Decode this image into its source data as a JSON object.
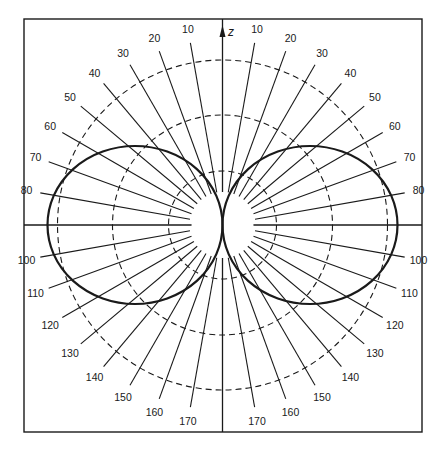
{
  "diagram": {
    "type": "polar radiation pattern",
    "axis_label": "z",
    "center": [
      222.5,
      225
    ],
    "frame": {
      "x": 24,
      "y": 19,
      "width": 398,
      "height": 413
    },
    "dashed_circle_radii": [
      54,
      110,
      165
    ],
    "inner_ellipse": {
      "rx": 31,
      "ry": 33
    },
    "lobes": [
      {
        "side": "left",
        "cx_offset": -87.5,
        "rx": 87.5,
        "ry": 79
      },
      {
        "side": "right",
        "cx_offset": 87.5,
        "rx": 87.5,
        "ry": 79
      }
    ],
    "radial_line": {
      "inner_r": 33,
      "outer_r": 185,
      "label_r": 199
    },
    "angle_labels": [
      "10",
      "20",
      "30",
      "40",
      "50",
      "60",
      "70",
      "80",
      "100",
      "110",
      "120",
      "130",
      "140",
      "150",
      "160",
      "170"
    ],
    "colors": {
      "ink": "#1a1a1a",
      "background": "#ffffff"
    }
  }
}
